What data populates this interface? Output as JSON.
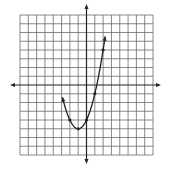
{
  "chart_data": {
    "type": "line",
    "title": "",
    "xlabel": "",
    "ylabel": "",
    "function": "y = (x + 1)^2 - 5",
    "xlim": [
      -8,
      8
    ],
    "ylim": [
      -8,
      8
    ],
    "grid": true,
    "legend": null,
    "series": [
      {
        "name": "parabola",
        "x_range": [
          -2.9,
          2.25
        ],
        "arrows_at_ends": true,
        "points": [
          {
            "x": -2,
            "y": -4
          },
          {
            "x": -1,
            "y": -5
          },
          {
            "x": 0,
            "y": -4
          },
          {
            "x": 1,
            "y": -1
          },
          {
            "x": 2,
            "y": 4
          }
        ]
      }
    ],
    "vertex": {
      "x": -1,
      "y": -5
    }
  },
  "layout": {
    "grid_left": 20,
    "grid_right": 153,
    "grid_top": 15,
    "grid_bottom": 155,
    "origin_x": 86.5,
    "origin_y": 85,
    "xaxis_left": 10,
    "xaxis_right": 161,
    "yaxis_top": 4,
    "yaxis_bottom": 164,
    "grid_color": "#6b6b6b",
    "axis_color": "#222222",
    "curve_color": "#222222"
  }
}
